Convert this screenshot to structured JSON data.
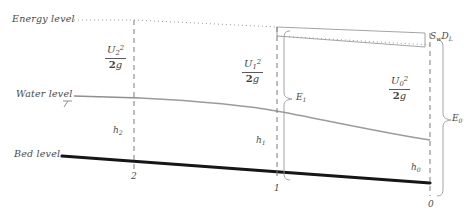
{
  "figure": {
    "type": "hydraulics-specific-energy-diagram",
    "width": 476,
    "height": 223,
    "background": "#ffffff",
    "line_colors": {
      "bed": "#161616",
      "water_surface": "#8f8f8f",
      "energy_line": "#9a9a9a",
      "station_dashed": "#7a7a7a",
      "bracket": "#9a9a9a",
      "text": "#434343"
    }
  },
  "level_labels": {
    "energy": "Energy level",
    "water": "Water level",
    "bed": "Bed level"
  },
  "stations": [
    {
      "id": "2",
      "label": "2",
      "x": 134
    },
    {
      "id": "1",
      "label": "1",
      "x": 277
    },
    {
      "id": "0",
      "label": "0",
      "x": 430
    }
  ],
  "velocity_heads": [
    {
      "id": "station-2",
      "numerator_var": "U",
      "numerator_sub": "2",
      "numerator_sup": "2",
      "denominator_coef": "2",
      "denominator_var": "g",
      "plain": "U2^2 / 2g"
    },
    {
      "id": "station-1",
      "numerator_var": "U",
      "numerator_sub": "1",
      "numerator_sup": "2",
      "denominator_coef": "2",
      "denominator_var": "g",
      "plain": "U1^2 / 2g"
    },
    {
      "id": "station-0",
      "numerator_var": "U",
      "numerator_sub": "0",
      "numerator_sup": "2",
      "denominator_coef": "2",
      "denominator_var": "g",
      "plain": "U0^2 / 2g"
    }
  ],
  "depths": [
    {
      "id": "h2",
      "var": "h",
      "sub": "2"
    },
    {
      "id": "h1",
      "var": "h",
      "sub": "1"
    },
    {
      "id": "h0",
      "var": "h",
      "sub": "0"
    }
  ],
  "energies": [
    {
      "id": "E1",
      "var": "E",
      "sub": "1"
    },
    {
      "id": "E0",
      "var": "E",
      "sub": "0"
    }
  ],
  "head_loss": {
    "id": "head-loss",
    "first_var": "S",
    "first_sub": "w",
    "second_var": "D",
    "second_sub": "L",
    "plain": "Sw DL"
  }
}
